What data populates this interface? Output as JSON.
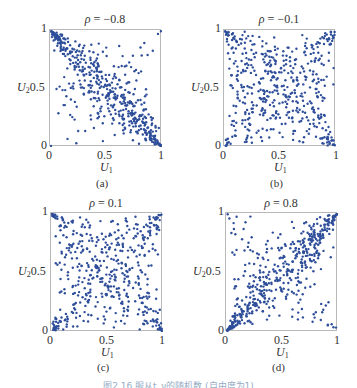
{
  "figure": {
    "caption": "图2.16  服从t_ν的随机数 (自由度为1)",
    "dot_color": "#2e4e9a",
    "frame_color": "#b8b8b8",
    "panels": [
      {
        "label": "(a)",
        "title_symbol": "ρ",
        "title_value": "= −0.8",
        "xlabel": "U",
        "xlabel_sub": "1",
        "ylabel": "U",
        "ylabel_sub": "2"
      },
      {
        "label": "(b)",
        "title_symbol": "ρ",
        "title_value": "= −0.1",
        "xlabel": "U",
        "xlabel_sub": "1",
        "ylabel": "U",
        "ylabel_sub": "2"
      },
      {
        "label": "(c)",
        "title_symbol": "ρ",
        "title_value": "= 0.1",
        "xlabel": "U",
        "xlabel_sub": "1",
        "ylabel": "U",
        "ylabel_sub": "2"
      },
      {
        "label": "(d)",
        "title_symbol": "ρ",
        "title_value": "= 0.8",
        "xlabel": "U",
        "xlabel_sub": "1",
        "ylabel": "U",
        "ylabel_sub": "2"
      }
    ],
    "ticks": {
      "x": [
        "0",
        "0.5",
        "1"
      ],
      "y": [
        "0",
        "0.5",
        "1"
      ]
    }
  },
  "chart_data": [
    {
      "type": "scatter",
      "title": "ρ = −0.8",
      "panel": "(a)",
      "xlabel": "U1",
      "ylabel": "U2",
      "xlim": [
        0,
        1
      ],
      "ylim": [
        0,
        1
      ],
      "xticks": [
        0,
        0.5,
        1
      ],
      "yticks": [
        0,
        0.5,
        1
      ],
      "grid": false,
      "correlation": -0.8,
      "n_points_approx": 500,
      "description": "Points concentrated along the anti-diagonal from (0,1) to (1,0), dense clusters at both corners (0,1) and (1,0), sparse off-diagonal scatter."
    },
    {
      "type": "scatter",
      "title": "ρ = −0.1",
      "panel": "(b)",
      "xlabel": "U1",
      "ylabel": "U2",
      "xlim": [
        0,
        1
      ],
      "ylim": [
        0,
        1
      ],
      "xticks": [
        0,
        0.5,
        1
      ],
      "yticks": [
        0,
        0.5,
        1
      ],
      "grid": false,
      "correlation": -0.1,
      "n_points_approx": 500,
      "description": "Nearly uniform scatter with tail clusters at all four corners, slightly heavier at (0,1) and (1,0)."
    },
    {
      "type": "scatter",
      "title": "ρ = 0.1",
      "panel": "(c)",
      "xlabel": "U1",
      "ylabel": "U2",
      "xlim": [
        0,
        1
      ],
      "ylim": [
        0,
        1
      ],
      "xticks": [
        0,
        0.5,
        1
      ],
      "yticks": [
        0,
        0.5,
        1
      ],
      "grid": false,
      "correlation": 0.1,
      "n_points_approx": 500,
      "description": "Nearly uniform scatter with tail clusters at all four corners, slightly heavier at (0,0) and (1,1)."
    },
    {
      "type": "scatter",
      "title": "ρ = 0.8",
      "panel": "(d)",
      "xlabel": "U1",
      "ylabel": "U2",
      "xlim": [
        0,
        1
      ],
      "ylim": [
        0,
        1
      ],
      "xticks": [
        0,
        0.5,
        1
      ],
      "yticks": [
        0,
        0.5,
        1
      ],
      "grid": false,
      "correlation": 0.8,
      "n_points_approx": 500,
      "description": "Points concentrated along the main diagonal from (0,0) to (1,1), dense clusters at both corners (0,0) and (1,1), sparse off-diagonal scatter including a few near (0,1) and (1,0)."
    }
  ]
}
